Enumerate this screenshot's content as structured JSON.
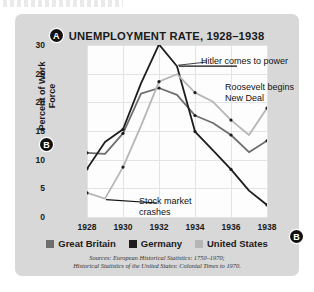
{
  "figure": {
    "marker_a": "A",
    "marker_b": "B",
    "marker_d": "D",
    "title": "UNEMPLOYMENT RATE, 1928–1938"
  },
  "annotations": {
    "hitler": "Hitler comes to power",
    "roosevelt": "Roosevelt begins New Deal",
    "stock": "Stock market crashes"
  },
  "legend": {
    "items": [
      {
        "label": "Great Britain",
        "color": "#6e6e6e"
      },
      {
        "label": "Germany",
        "color": "#1d1d1d"
      },
      {
        "label": "United States",
        "color": "#b6b6b6"
      }
    ]
  },
  "sources": {
    "line1": "Sources: European Historical Statistics: 1750–1970;",
    "line2": "Historical Statistics of the United States: Colonial Times to 1970."
  },
  "chart_data": {
    "type": "line",
    "title": "UNEMPLOYMENT RATE, 1928–1938",
    "xlabel": "",
    "ylabel": "Percent of Work Force",
    "x": [
      1928,
      1929,
      1930,
      1931,
      1932,
      1933,
      1934,
      1935,
      1936,
      1937,
      1938
    ],
    "xticks": [
      1928,
      1930,
      1932,
      1934,
      1936,
      1938
    ],
    "yticks": [
      0,
      5,
      10,
      15,
      20,
      25,
      30
    ],
    "xlim": [
      1928,
      1938
    ],
    "ylim": [
      0,
      30
    ],
    "grid": true,
    "legend_position": "bottom",
    "series": [
      {
        "name": "Great Britain",
        "color": "#6e6e6e",
        "values": [
          11.2,
          11.0,
          14.6,
          21.5,
          22.5,
          21.3,
          17.7,
          16.4,
          14.3,
          11.3,
          13.3
        ]
      },
      {
        "name": "Germany",
        "color": "#1d1d1d",
        "values": [
          8.4,
          13.1,
          15.3,
          23.3,
          30.1,
          26.3,
          14.9,
          11.6,
          8.3,
          4.6,
          2.1
        ]
      },
      {
        "name": "United States",
        "color": "#b6b6b6",
        "values": [
          4.2,
          3.2,
          8.7,
          15.9,
          23.6,
          24.9,
          21.7,
          20.1,
          16.9,
          14.3,
          19.0
        ]
      }
    ],
    "annotations": [
      {
        "text": "Hitler comes to power",
        "x": 1933
      },
      {
        "text": "Roosevelt begins New Deal",
        "x": 1933
      },
      {
        "text": "Stock market crashes",
        "x": 1929
      }
    ]
  }
}
